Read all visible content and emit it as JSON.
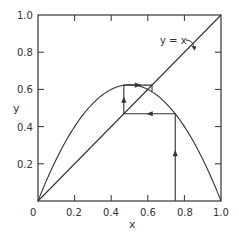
{
  "chart_data": {
    "type": "line",
    "title": "",
    "xlabel": "x",
    "ylabel": "y",
    "xlim": [
      0,
      1.0
    ],
    "ylim": [
      0,
      1.0
    ],
    "grid": false,
    "x_ticks": [
      "0",
      "0.2",
      "0.4",
      "0.6",
      "0.8",
      "1.0"
    ],
    "y_ticks": [
      "0.2",
      "0.4",
      "0.6",
      "0.8",
      "1.0"
    ],
    "x_tick_values": [
      0,
      0.2,
      0.4,
      0.6,
      0.8,
      1.0
    ],
    "y_tick_values": [
      0.2,
      0.4,
      0.6,
      0.8,
      1.0
    ],
    "series": [
      {
        "name": "f(x) = r x (1 - x)",
        "kind": "curve",
        "r": 2.5,
        "x": [
          0,
          0.1,
          0.2,
          0.3,
          0.4,
          0.5,
          0.6,
          0.7,
          0.8,
          0.9,
          1.0
        ],
        "y": [
          0,
          0.225,
          0.4,
          0.525,
          0.6,
          0.625,
          0.6,
          0.525,
          0.4,
          0.225,
          0
        ]
      },
      {
        "name": "y = x",
        "kind": "diagonal",
        "x": [
          0,
          1.0
        ],
        "y": [
          0,
          1.0
        ]
      },
      {
        "name": "cobweb",
        "kind": "iteration-path",
        "x0": 0.75,
        "points": [
          [
            0.75,
            0.0
          ],
          [
            0.75,
            0.469
          ],
          [
            0.469,
            0.469
          ],
          [
            0.469,
            0.623
          ],
          [
            0.623,
            0.623
          ],
          [
            0.623,
            0.587
          ]
        ]
      }
    ],
    "annotations": [
      {
        "text": "y = x",
        "x": 0.66,
        "y": 0.85,
        "arrow_to": [
          0.83,
          0.83
        ]
      }
    ],
    "fixed_point": [
      0.6,
      0.6
    ]
  },
  "labels": {
    "x_axis": "x",
    "y_axis": "y",
    "diagonal": "y = x",
    "x_ticks": [
      "0",
      "0.2",
      "0.4",
      "0.6",
      "0.8",
      "1.0"
    ],
    "y_ticks": [
      "0.2",
      "0.4",
      "0.6",
      "0.8",
      "1.0"
    ]
  }
}
